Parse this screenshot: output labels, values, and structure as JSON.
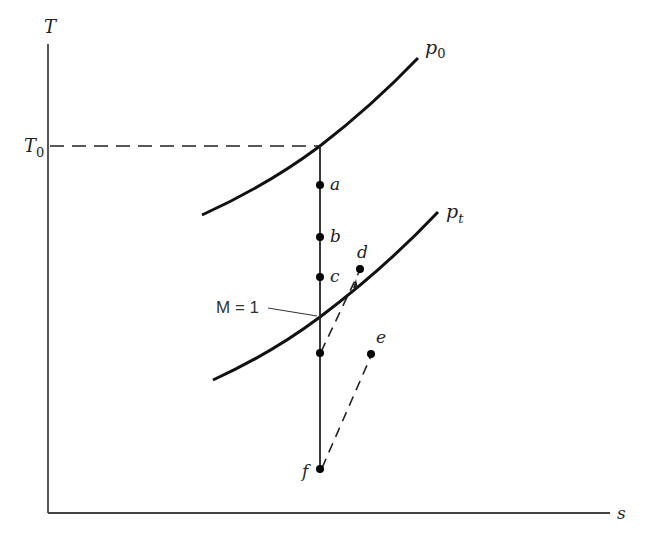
{
  "diagram": {
    "type": "temperature-entropy (T-s) diagram",
    "axes": {
      "y_label": "T",
      "x_label": "s",
      "reference_level_label": "T",
      "reference_level_subscript": "0"
    },
    "curves": [
      {
        "name": "p0",
        "label_main": "p",
        "label_sub": "0"
      },
      {
        "name": "pt",
        "label_main": "p",
        "label_sub": "t"
      }
    ],
    "points": [
      {
        "label": "a"
      },
      {
        "label": "b"
      },
      {
        "label": "c"
      },
      {
        "label": "d"
      },
      {
        "label": "e"
      },
      {
        "label": "f"
      }
    ],
    "annotation": {
      "mach_label": "M = 1"
    },
    "colors": {
      "line": "#1a1a1a",
      "axis": "#444444",
      "background": "#ffffff"
    }
  }
}
